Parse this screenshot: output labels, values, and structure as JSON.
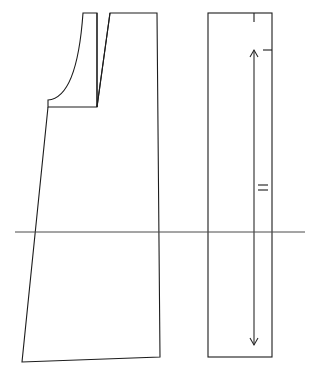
{
  "canvas": {
    "width": 322,
    "height": 372,
    "background": "#ffffff",
    "title": "Garment pattern draft"
  },
  "style": {
    "outline_color": "#1c1c1c",
    "outline_width": 1.1,
    "reference_line_color": "#4a4a4a",
    "arrow_color": "#2a2a2a"
  },
  "pieces": [
    {
      "id": "front-bodice-piece",
      "name": "Front bodice / A-line skirt panel",
      "type": "polyline-with-curve",
      "outline_points": [
        [
          83,
          13
        ],
        [
          97,
          13
        ],
        [
          97,
          107
        ],
        [
          48,
          107
        ],
        [
          48,
          100
        ]
      ],
      "armhole_curve": {
        "start": [
          48,
          100
        ],
        "control1": [
          62,
          99
        ],
        "control2": [
          78,
          84
        ],
        "end": [
          83,
          13
        ]
      },
      "side_path_points": [
        [
          97,
          107
        ],
        [
          110,
          13
        ],
        [
          157,
          13
        ],
        [
          160,
          357
        ],
        [
          22,
          362
        ],
        [
          48,
          107
        ]
      ]
    },
    {
      "id": "grainline-rectangle-piece",
      "name": "Straight rectangular panel with grainline",
      "type": "rectangle",
      "x": 208,
      "y": 13,
      "width": 64,
      "height": 344
    }
  ],
  "dart": {
    "name": "shoulder-dart",
    "left_leg": [
      [
        97,
        13
      ],
      [
        97,
        107
      ]
    ],
    "right_leg": [
      [
        110,
        13
      ],
      [
        97,
        107
      ]
    ],
    "apex": [
      97,
      107
    ]
  },
  "notches": [
    {
      "id": "top-notch",
      "name": "top-edge-notch",
      "orientation": "vertical",
      "x": 254,
      "y1": 13,
      "y2": 22
    },
    {
      "id": "side-notch",
      "name": "right-edge-notch",
      "orientation": "horizontal",
      "x1": 263,
      "x2": 272,
      "y": 50
    },
    {
      "id": "double-notch-upper",
      "name": "grainline-double-notch-upper",
      "orientation": "horizontal",
      "x1": 258,
      "x2": 268,
      "y": 185
    },
    {
      "id": "double-notch-lower",
      "name": "grainline-double-notch-lower",
      "orientation": "horizontal",
      "x1": 258,
      "x2": 268,
      "y": 190
    }
  ],
  "grainline": {
    "name": "grainline-double-arrow",
    "x": 254,
    "y_top": 50,
    "y_bottom": 345,
    "head_size": 6
  },
  "reference_line": {
    "name": "horizontal-reference-line",
    "x1": 15,
    "x2": 305,
    "y": 232
  }
}
